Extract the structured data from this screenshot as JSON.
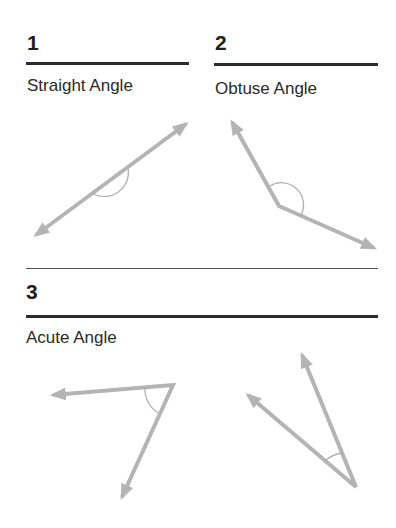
{
  "panels": [
    {
      "number": "1",
      "title": "Straight Angle",
      "angle_type": "straight"
    },
    {
      "number": "2",
      "title": "Obtuse Angle",
      "angle_type": "obtuse"
    },
    {
      "number": "3",
      "title": "Acute Angle",
      "angle_type": "acute"
    }
  ],
  "colors": {
    "text": "#222222",
    "rule": "#2b2b2b",
    "ray": "#b4b4b4",
    "arc": "#b0b0b0"
  }
}
